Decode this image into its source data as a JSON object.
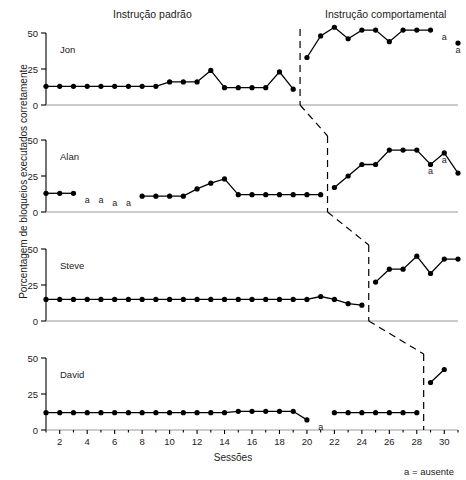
{
  "headers": {
    "baseline_phase": "Instrução padrão",
    "treatment_phase": "Instrução comportamental"
  },
  "axis": {
    "ylabel": "Porcentagem de bloqueios executados corretamente",
    "xlabel": "Sessões",
    "yticks": [
      "0",
      "25",
      "50"
    ],
    "xticks": [
      "2",
      "4",
      "6",
      "8",
      "10",
      "12",
      "14",
      "16",
      "18",
      "20",
      "22",
      "24",
      "26",
      "28",
      "30"
    ]
  },
  "legend": {
    "absent_note": "a = ausente"
  },
  "subjects": {
    "jon": "Jon",
    "alan": "Alan",
    "steve": "Steve",
    "david": "David"
  },
  "chart_data": {
    "type": "line",
    "xlabel": "Sessões",
    "ylabel": "Porcentagem de bloqueios executados corretamente",
    "xlim": [
      1,
      31
    ],
    "ylim": [
      0,
      55
    ],
    "yticks": [
      0,
      25,
      50
    ],
    "xticks": [
      2,
      4,
      6,
      8,
      10,
      12,
      14,
      16,
      18,
      20,
      22,
      24,
      26,
      28,
      30
    ],
    "grid": false,
    "legend_position": "bottom-right",
    "design": "multiple-baseline across participants",
    "phases": [
      {
        "name": "Instrução padrão",
        "label_x": 11
      },
      {
        "name": "Instrução comportamental",
        "label_x": 26
      }
    ],
    "absent_marker": "a",
    "absent_note": "a = ausente",
    "panels": [
      {
        "name": "Jon",
        "phase_change_x": 19.5,
        "series": [
          {
            "name": "Instrução padrão",
            "x": [
              1,
              2,
              3,
              4,
              5,
              6,
              7,
              8,
              9,
              10,
              11,
              12,
              13,
              14,
              15,
              16,
              17,
              18,
              19
            ],
            "values": [
              13,
              13,
              13,
              13,
              13,
              13,
              13,
              13,
              13,
              16,
              16,
              16,
              24,
              12,
              12,
              12,
              12,
              23,
              11
            ]
          },
          {
            "name": "Instrução comportamental",
            "x": [
              20,
              21,
              22,
              23,
              24,
              25,
              26,
              27,
              28,
              29,
              30,
              31
            ],
            "values": [
              33,
              48,
              54,
              46,
              52,
              52,
              44,
              52,
              52,
              52,
              null,
              43
            ]
          }
        ],
        "absent_sessions": [
          30,
          31
        ]
      },
      {
        "name": "Alan",
        "phase_change_x": 21.5,
        "series": [
          {
            "name": "Instrução padrão",
            "x": [
              1,
              2,
              3,
              4,
              5,
              6,
              7,
              8,
              9,
              10,
              11,
              12,
              13,
              14,
              15,
              16,
              17,
              18,
              19,
              20,
              21
            ],
            "values": [
              13,
              13,
              13,
              null,
              null,
              null,
              null,
              11,
              11,
              11,
              11,
              16,
              20,
              23,
              12,
              12,
              12,
              12,
              12,
              12,
              12
            ]
          },
          {
            "name": "Instrução comportamental",
            "x": [
              22,
              23,
              24,
              25,
              26,
              27,
              28,
              29,
              30,
              31
            ],
            "values": [
              17,
              25,
              33,
              33,
              43,
              43,
              43,
              33,
              41,
              27
            ]
          }
        ],
        "absent_sessions": [
          4,
          5,
          6,
          7,
          29,
          30
        ]
      },
      {
        "name": "Steve",
        "phase_change_x": 24.5,
        "series": [
          {
            "name": "Instrução padrão",
            "x": [
              1,
              2,
              3,
              4,
              5,
              6,
              7,
              8,
              9,
              10,
              11,
              12,
              13,
              14,
              15,
              16,
              17,
              18,
              19,
              20,
              21,
              22,
              23,
              24
            ],
            "values": [
              15,
              15,
              15,
              15,
              15,
              15,
              15,
              15,
              15,
              15,
              15,
              15,
              15,
              15,
              15,
              15,
              15,
              15,
              15,
              15,
              17,
              15,
              12,
              11
            ]
          },
          {
            "name": "Instrução comportamental",
            "x": [
              25,
              26,
              27,
              28,
              29,
              30,
              31
            ],
            "values": [
              27,
              36,
              36,
              45,
              33,
              43,
              43
            ]
          }
        ],
        "absent_sessions": []
      },
      {
        "name": "David",
        "phase_change_x": 28.5,
        "series": [
          {
            "name": "Instrução padrão",
            "x": [
              1,
              2,
              3,
              4,
              5,
              6,
              7,
              8,
              9,
              10,
              11,
              12,
              13,
              14,
              15,
              16,
              17,
              18,
              19,
              20,
              21,
              22,
              23,
              24,
              25,
              26,
              27,
              28
            ],
            "values": [
              12,
              12,
              12,
              12,
              12,
              12,
              12,
              12,
              12,
              12,
              12,
              12,
              12,
              12,
              13,
              13,
              13,
              13,
              13,
              7,
              null,
              12,
              12,
              12,
              12,
              12,
              12,
              12
            ]
          },
          {
            "name": "Instrução comportamental",
            "x": [
              29,
              30
            ],
            "values": [
              33,
              42
            ]
          }
        ],
        "absent_sessions": [
          21
        ]
      }
    ]
  }
}
